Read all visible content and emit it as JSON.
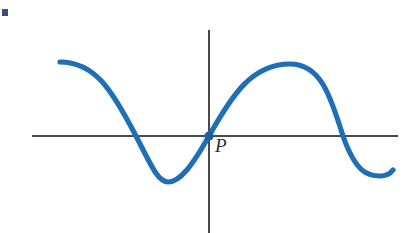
{
  "figure": {
    "title": "",
    "background_color": "#ffffff",
    "width": 417,
    "height": 233,
    "corner_mark": {
      "name": "corner-mark",
      "color": "#3a4a86",
      "x": 2,
      "y": 9,
      "width": 6,
      "height": 7
    },
    "axes": {
      "color": "#4a4a4a",
      "stroke_width": 1.4,
      "origin": {
        "x": 209,
        "y": 136
      },
      "x_axis": {
        "x1": 32,
        "y1": 136,
        "x2": 398,
        "y2": 136
      },
      "y_axis": {
        "x1": 209,
        "y1": 30,
        "x2": 209,
        "y2": 233
      }
    },
    "labels": [
      {
        "name": "point-label-P",
        "text": "P",
        "x": 215,
        "y": 136,
        "style": "italic-serif",
        "color": "#2b2b2b"
      }
    ],
    "marked_points": [
      {
        "name": "point-P",
        "label": "P",
        "x": 209,
        "y": 136,
        "radius": 4.6,
        "color": "#1a5f9e"
      }
    ]
  },
  "chart_data": {
    "type": "line",
    "title": "",
    "subtitle": "",
    "xlabel": "",
    "ylabel": "",
    "grid": false,
    "legend": null,
    "axis_style": "cartesian-origin-cross",
    "series": [
      {
        "name": "curve",
        "color": "#1f6fb5",
        "stroke_width": 5.2,
        "description": "Smooth sinusoid-like curve passing through the origin P with positive slope; falls from the left to a trough, rises through P to a crest, then falls to a shallow trough at the right edge.",
        "path": "M 60 62 C 95 62 112 90 136 136 C 152 167 158 182 168 182 C 180 182 192 166 209 136 C 232 95 252 64 290 64 C 320 64 330 94 343 136 C 356 173 368 176 380 176 C 386 176 390 174 393 170",
        "points": [
          {
            "x": 60,
            "y": 62,
            "role": "left-endpoint"
          },
          {
            "x": 136,
            "y": 136,
            "role": "x-intercept-left"
          },
          {
            "x": 168,
            "y": 182,
            "role": "minimum-left"
          },
          {
            "x": 209,
            "y": 136,
            "role": "origin-point-P"
          },
          {
            "x": 290,
            "y": 64,
            "role": "maximum"
          },
          {
            "x": 343,
            "y": 136,
            "role": "x-intercept-right"
          },
          {
            "x": 381,
            "y": 177,
            "role": "minimum-right"
          },
          {
            "x": 393,
            "y": 170,
            "role": "right-endpoint"
          }
        ],
        "x_intercepts": [
          136,
          209,
          343
        ],
        "extrema": [
          {
            "type": "minimum",
            "x": 168,
            "y": 182
          },
          {
            "type": "maximum",
            "x": 290,
            "y": 64
          },
          {
            "type": "minimum",
            "x": 381,
            "y": 177
          }
        ]
      }
    ],
    "annotations": [
      {
        "text": "P",
        "x": 215,
        "y": 136,
        "target_x": 209,
        "target_y": 136
      }
    ]
  }
}
